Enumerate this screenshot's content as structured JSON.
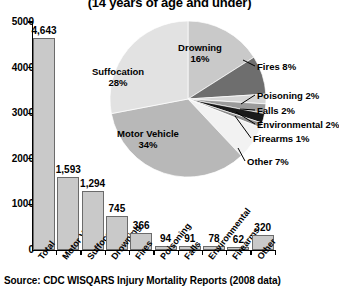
{
  "title": {
    "subtitle": "(14 years of age and under)"
  },
  "source": {
    "text": "Source:  CDC WISQARS Injury Mortality Reports (2008 data)"
  },
  "chart_data": [
    {
      "type": "bar",
      "title": "(14 years of age and under)",
      "xlabel": "",
      "ylabel": "",
      "ylim": [
        0,
        5000
      ],
      "grid": false,
      "categories": [
        "Total",
        "Motor Vehicle",
        "Suffocation",
        "Drowning",
        "Fires",
        "Poisoning",
        "Falls",
        "Environmental",
        "Firearms",
        "Other"
      ],
      "values": [
        4643,
        1593,
        1294,
        745,
        366,
        94,
        91,
        78,
        62,
        320
      ],
      "value_labels": [
        "4,643",
        "1,593",
        "1,294",
        "745",
        "366",
        "94",
        "91",
        "78",
        "62",
        "320"
      ],
      "ytick_labels": [
        "5000",
        "4000",
        "3000",
        "2000",
        "1000",
        "0"
      ],
      "ytick_values": [
        5000,
        4000,
        3000,
        2000,
        1000,
        0
      ],
      "bar_color": "#c9c9c9",
      "bar_edge_color": "#6b6b6b"
    },
    {
      "type": "pie",
      "title": "",
      "legend": "labels",
      "categories": [
        "Suffocation",
        "Motor Vehicle",
        "Drowning",
        "Fires",
        "Poisoning",
        "Falls",
        "Environmental",
        "Firearms",
        "Other"
      ],
      "values": [
        28,
        34,
        16,
        8,
        2,
        2,
        2,
        1,
        7
      ],
      "inner_labels": [
        {
          "name": "Suffocation",
          "pct": "28%",
          "color": "#e2e2e2"
        },
        {
          "name": "Motor Vehicle",
          "pct": "34%",
          "color": "#b8b8b8"
        },
        {
          "name": "Drowning",
          "pct": "16%",
          "color": "#c9c9c9"
        }
      ],
      "callout_labels": [
        {
          "name": "Fires 8%",
          "color": "#6e6e6e"
        },
        {
          "name": "Poisoning 2%",
          "color": "#d6d6d6"
        },
        {
          "name": "Falls 2%",
          "color": "#9b9b9b"
        },
        {
          "name": "Environmental 2%",
          "color": "#1a1a1a"
        },
        {
          "name": "Firearms 1%",
          "color": "#8a8a8a"
        },
        {
          "name": "Other 7%",
          "color": "#f2f2f2"
        }
      ]
    }
  ]
}
